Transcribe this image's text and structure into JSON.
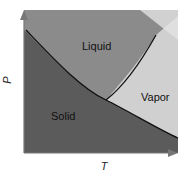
{
  "diagram": {
    "type": "phase-diagram",
    "axes": {
      "x_label": "T",
      "y_label": "P"
    },
    "regions": [
      {
        "name": "solid",
        "label": "Solid",
        "color": "#5b5b5b"
      },
      {
        "name": "liquid",
        "label": "Liquid",
        "color": "#8b8b8b"
      },
      {
        "name": "vapor",
        "label": "Vapor",
        "color": "#d0d0d0"
      }
    ],
    "boundaries": [
      {
        "name": "solid-boundary",
        "from": "top-left",
        "through": "triple-point",
        "to": "bottom-right"
      },
      {
        "name": "vaporization-curve",
        "from": "triple-point",
        "to": "upper-right"
      }
    ],
    "line_color": "#111111"
  }
}
